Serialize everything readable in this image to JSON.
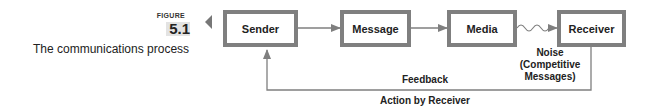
{
  "figure": {
    "label": "FIGURE",
    "number": "5.1",
    "caption": "The communications process"
  },
  "diagram": {
    "nodes": [
      {
        "id": "sender",
        "label": "Sender"
      },
      {
        "id": "message",
        "label": "Message"
      },
      {
        "id": "media",
        "label": "Media"
      },
      {
        "id": "receiver",
        "label": "Receiver"
      }
    ],
    "edges": [
      {
        "from": "sender",
        "to": "message"
      },
      {
        "from": "message",
        "to": "media"
      },
      {
        "from": "media",
        "to": "receiver",
        "style": "wavy"
      },
      {
        "from": "receiver",
        "to": "sender",
        "style": "feedback-loop"
      }
    ],
    "noise_label": "Noise\n(Competitive\nMessages)",
    "noise_lines": [
      "Noise",
      "(Competitive",
      "Messages)"
    ],
    "feedback_label": "Feedback",
    "action_label": "Action by Receiver",
    "colors": {
      "box_border": "#7f7f7f",
      "line": "#7f7f7f",
      "text": "#222222"
    }
  }
}
